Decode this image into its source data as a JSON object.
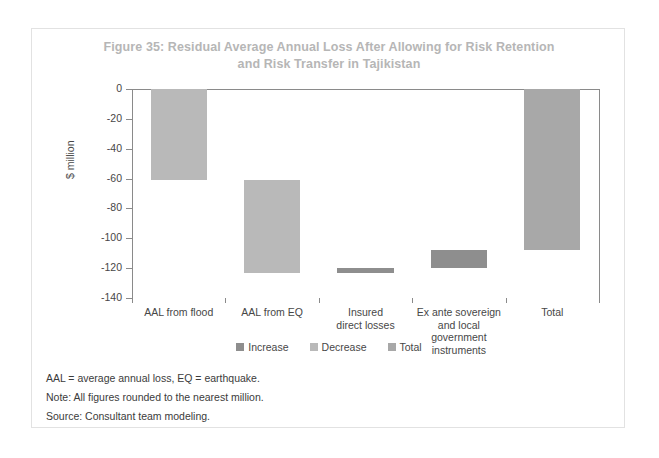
{
  "figure": {
    "title_line1": "Figure 35: Residual Average Annual Loss After Allowing for Risk Retention",
    "title_line2": "and Risk Transfer in Tajikistan",
    "notes": [
      "AAL = average annual loss, EQ = earthquake.",
      "Note: All figures rounded to the nearest million.",
      "Source: Consultant team modeling."
    ]
  },
  "colors": {
    "increase": "#8e8e8e",
    "decrease": "#b9b9b9",
    "total": "#a8a8a8",
    "axis": "#8a8a8a",
    "title": "#b6b6b6",
    "text": "#3b3b3b",
    "frame": "#e2e2e2"
  },
  "chart_data": {
    "type": "bar",
    "chart_subtype": "waterfall",
    "title": "Figure 35: Residual Average Annual Loss After Allowing for Risk Retention and Risk Transfer in Tajikistan",
    "xlabel": "",
    "ylabel": "$ million",
    "ylim": [
      -140,
      0
    ],
    "yticks": [
      0,
      -20,
      -40,
      -60,
      -80,
      -100,
      -120,
      -140
    ],
    "ytick_labels": [
      "0",
      "-20",
      "-40",
      "-60",
      "-80",
      "-100",
      "-120",
      "-140"
    ],
    "grid": false,
    "legend_position": "bottom",
    "categories": [
      "AAL from flood",
      "AAL from EQ",
      "Insured direct losses",
      "Ex ante sovereign and local government instruments",
      "Total"
    ],
    "category_labels": [
      [
        "AAL from flood"
      ],
      [
        "AAL from EQ"
      ],
      [
        "Insured",
        "direct losses"
      ],
      [
        "Ex ante sovereign",
        "and local government",
        "instruments"
      ],
      [
        "Total"
      ]
    ],
    "legend": [
      {
        "label": "Increase",
        "color": "#8e8e8e"
      },
      {
        "label": "Decrease",
        "color": "#b9b9b9"
      },
      {
        "label": "Total",
        "color": "#a8a8a8"
      }
    ],
    "bars": [
      {
        "category": "AAL from flood",
        "series": "Decrease",
        "start": 0,
        "end": -61,
        "delta": -61,
        "color": "#b9b9b9"
      },
      {
        "category": "AAL from EQ",
        "series": "Decrease",
        "start": -61,
        "end": -123,
        "delta": -62,
        "color": "#b9b9b9"
      },
      {
        "category": "Insured direct losses",
        "series": "Increase",
        "start": -123,
        "end": -120,
        "delta": 3,
        "color": "#8e8e8e"
      },
      {
        "category": "Ex ante sovereign and local government instruments",
        "series": "Increase",
        "start": -120,
        "end": -108,
        "delta": 12,
        "color": "#8e8e8e"
      },
      {
        "category": "Total",
        "series": "Total",
        "start": 0,
        "end": -108,
        "delta": -108,
        "color": "#a8a8a8"
      }
    ]
  }
}
